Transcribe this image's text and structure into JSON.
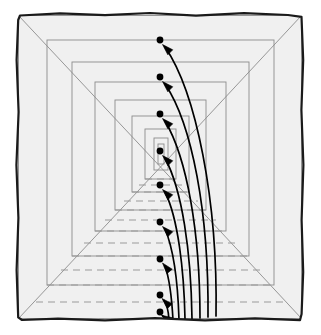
{
  "figure": {
    "caption": "",
    "width": 321,
    "height": 335,
    "background_color": "#ffffff"
  },
  "chart_data": {
    "type": "diagram",
    "xlabel": "",
    "ylabel": "",
    "grid": false,
    "legend": null,
    "vanishing_point": {
      "x": 160.5,
      "y": 167.0
    },
    "outer_frame": {
      "label": "hand-drawn outer border",
      "stroke_color": "#1a1a1a",
      "stroke_width": 2.2,
      "fill_color": "#f0f0f0",
      "points": [
        [
          20.0,
          15.5
        ],
        [
          60.0,
          13.4
        ],
        [
          105.0,
          15.2
        ],
        [
          150.0,
          13.0
        ],
        [
          196.0,
          15.6
        ],
        [
          244.0,
          13.2
        ],
        [
          288.0,
          15.0
        ],
        [
          301.5,
          16.8
        ],
        [
          303.2,
          60.0
        ],
        [
          301.4,
          110.0
        ],
        [
          303.4,
          165.0
        ],
        [
          301.6,
          220.0
        ],
        [
          303.2,
          272.0
        ],
        [
          301.6,
          314.0
        ],
        [
          300.0,
          320.2
        ],
        [
          255.0,
          318.4
        ],
        [
          205.0,
          320.4
        ],
        [
          155.0,
          318.2
        ],
        [
          105.0,
          320.4
        ],
        [
          58.0,
          318.6
        ],
        [
          22.0,
          320.0
        ],
        [
          18.2,
          317.4
        ],
        [
          16.6,
          270.0
        ],
        [
          18.4,
          218.0
        ],
        [
          16.4,
          165.0
        ],
        [
          18.6,
          112.0
        ],
        [
          16.6,
          60.0
        ],
        [
          18.2,
          20.0
        ]
      ]
    },
    "nested_squares": {
      "label": "concentric perspective rectangles receding to vanishing point",
      "count": 9,
      "stroke_color": "#8c8c8c",
      "stroke_width": 0.9,
      "fill_color": "#f0f0f0",
      "rects": [
        {
          "index": 1,
          "x": 18.5,
          "y": 15.5,
          "w": 283.0,
          "h": 303.0
        },
        {
          "index": 2,
          "x": 47.0,
          "y": 40.0,
          "w": 227.0,
          "h": 245.0
        },
        {
          "index": 3,
          "x": 72.0,
          "y": 62.0,
          "w": 177.0,
          "h": 194.0
        },
        {
          "index": 4,
          "x": 95.0,
          "y": 82.0,
          "w": 131.0,
          "h": 149.0
        },
        {
          "index": 5,
          "x": 115.0,
          "y": 100.0,
          "w": 91.0,
          "h": 110.0
        },
        {
          "index": 6,
          "x": 132.0,
          "y": 116.0,
          "w": 57.0,
          "h": 76.0
        },
        {
          "index": 7,
          "x": 145.0,
          "y": 129.0,
          "w": 31.0,
          "h": 50.0
        },
        {
          "index": 8,
          "x": 154.0,
          "y": 138.0,
          "w": 14.0,
          "h": 32.0
        },
        {
          "index": 9,
          "x": 158.0,
          "y": 144.0,
          "w": 6.0,
          "h": 20.0
        }
      ]
    },
    "diagonals": {
      "label": "corner rays converging on vanishing point",
      "stroke_color": "#8c8c8c",
      "stroke_width": 0.9,
      "lines": [
        {
          "from": [
            18.5,
            15.5
          ],
          "to": [
            160.5,
            167.0
          ],
          "corner": "top-left"
        },
        {
          "from": [
            301.5,
            15.5
          ],
          "to": [
            160.5,
            167.0
          ],
          "corner": "top-right"
        },
        {
          "from": [
            18.5,
            318.5
          ],
          "to": [
            160.5,
            167.0
          ],
          "corner": "bottom-left"
        },
        {
          "from": [
            301.5,
            318.5
          ],
          "to": [
            160.5,
            167.0
          ],
          "corner": "bottom-right"
        }
      ]
    },
    "floor_dashes": {
      "label": "dashed texture lines on corridor floor",
      "stroke_color": "#9a9a9a",
      "stroke_width": 1.1,
      "dash_pattern": "7 5",
      "rows": [
        {
          "y": 318.5,
          "x1": 20.0,
          "x2": 300.0
        },
        {
          "y": 302.0,
          "x1": 36.0,
          "x2": 285.0
        },
        {
          "y": 285.0,
          "x1": 47.0,
          "x2": 274.0
        },
        {
          "y": 270.0,
          "x1": 61.0,
          "x2": 260.0
        },
        {
          "y": 256.0,
          "x1": 72.0,
          "x2": 249.0
        },
        {
          "y": 243.0,
          "x1": 84.0,
          "x2": 238.0
        },
        {
          "y": 231.0,
          "x1": 95.0,
          "x2": 226.0
        },
        {
          "y": 220.0,
          "x1": 105.0,
          "x2": 216.0
        },
        {
          "y": 210.0,
          "x1": 115.0,
          "x2": 206.0
        },
        {
          "y": 201.0,
          "x1": 124.0,
          "x2": 198.0
        },
        {
          "y": 192.0,
          "x1": 132.0,
          "x2": 189.0
        },
        {
          "y": 185.0,
          "x1": 139.0,
          "x2": 182.0
        },
        {
          "y": 179.0,
          "x1": 145.0,
          "x2": 176.0
        }
      ]
    },
    "dots": {
      "label": "arrow head target points aligned on vertical axis",
      "count": 9,
      "fill_color": "#000000",
      "radius": 3.4,
      "points": [
        {
          "index": 1,
          "x": 160.0,
          "y": 40.0
        },
        {
          "index": 2,
          "x": 160.0,
          "y": 77.0
        },
        {
          "index": 3,
          "x": 160.0,
          "y": 114.0
        },
        {
          "index": 4,
          "x": 160.0,
          "y": 151.0
        },
        {
          "index": 5,
          "x": 160.0,
          "y": 185.0
        },
        {
          "index": 6,
          "x": 160.0,
          "y": 222.0
        },
        {
          "index": 7,
          "x": 160.0,
          "y": 259.0
        },
        {
          "index": 8,
          "x": 160.0,
          "y": 295.0
        },
        {
          "index": 9,
          "x": 160.0,
          "y": 312.0
        }
      ]
    },
    "arrows": {
      "label": "curved arrows rising from bottom right toward each dot",
      "count": 9,
      "stroke_color": "#000000",
      "stroke_width": 1.7,
      "head_length": 11,
      "head_width": 7,
      "curves": [
        {
          "index": 1,
          "start": [
            216.0,
            316.0
          ],
          "c1": [
            218.0,
            200.0
          ],
          "c2": [
            196.0,
            92.0
          ],
          "end": [
            165.0,
            47.0
          ],
          "tip": [
            162.5,
            44.5
          ]
        },
        {
          "index": 2,
          "start": [
            208.0,
            317.0
          ],
          "c1": [
            209.0,
            212.0
          ],
          "c2": [
            192.0,
            124.0
          ],
          "end": [
            165.0,
            84.0
          ],
          "tip": [
            162.5,
            81.5
          ]
        },
        {
          "index": 3,
          "start": [
            200.0,
            318.0
          ],
          "c1": [
            200.0,
            232.0
          ],
          "c2": [
            187.0,
            158.0
          ],
          "end": [
            165.0,
            121.0
          ],
          "tip": [
            162.5,
            118.5
          ]
        },
        {
          "index": 4,
          "start": [
            192.0,
            318.5
          ],
          "c1": [
            191.0,
            250.0
          ],
          "c2": [
            182.0,
            190.0
          ],
          "end": [
            165.0,
            158.0
          ],
          "tip": [
            162.5,
            155.5
          ]
        },
        {
          "index": 5,
          "start": [
            185.0,
            319.0
          ],
          "c1": [
            184.0,
            270.0
          ],
          "c2": [
            178.0,
            218.0
          ],
          "end": [
            165.0,
            192.0
          ],
          "tip": [
            162.5,
            189.5
          ]
        },
        {
          "index": 6,
          "start": [
            179.0,
            319.5
          ],
          "c1": [
            178.0,
            288.0
          ],
          "c2": [
            174.0,
            250.0
          ],
          "end": [
            165.0,
            229.0
          ],
          "tip": [
            162.5,
            226.5
          ]
        },
        {
          "index": 7,
          "start": [
            173.0,
            320.0
          ],
          "c1": [
            172.0,
            302.0
          ],
          "c2": [
            170.0,
            280.0
          ],
          "end": [
            165.0,
            266.0
          ],
          "tip": [
            162.5,
            263.0
          ]
        },
        {
          "index": 8,
          "start": [
            169.0,
            320.0
          ],
          "c1": [
            168.5,
            312.0
          ],
          "c2": [
            167.0,
            304.0
          ],
          "end": [
            164.0,
            300.5
          ],
          "tip": [
            162.0,
            298.5
          ]
        },
        {
          "index": 9,
          "start": [
            164.5,
            319.0
          ],
          "c1": [
            164.0,
            317.5
          ],
          "c2": [
            163.5,
            316.5
          ],
          "end": [
            162.5,
            315.8
          ],
          "tip": [
            161.5,
            315.2
          ]
        }
      ]
    },
    "colors": {
      "ink": "#1a1a1a",
      "line_gray": "#8c8c8c",
      "dash_gray": "#9a9a9a",
      "panel_fill": "#f0f0f0",
      "accent": "#000000",
      "page": "#ffffff"
    }
  }
}
